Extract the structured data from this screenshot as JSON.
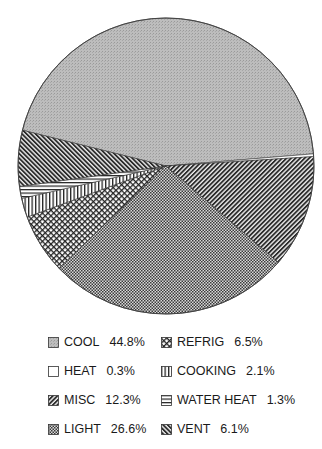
{
  "chart_data": {
    "type": "pie",
    "title": "",
    "start_angle_deg": -166,
    "direction": "clockwise",
    "slices": [
      {
        "label": "COOL",
        "value": 44.8,
        "pattern": "gray-fine",
        "fill": "#b8b8b8"
      },
      {
        "label": "HEAT",
        "value": 0.3,
        "pattern": "white",
        "fill": "#ffffff"
      },
      {
        "label": "MISC",
        "value": 12.3,
        "pattern": "diag-down",
        "fill": "#555555"
      },
      {
        "label": "LIGHT",
        "value": 26.6,
        "pattern": "checker",
        "fill": "#7a7a7a"
      },
      {
        "label": "REFRIG",
        "value": 6.5,
        "pattern": "crosshatch",
        "fill": "#888888"
      },
      {
        "label": "COOKING",
        "value": 2.1,
        "pattern": "vertical",
        "fill": "#cccccc"
      },
      {
        "label": "WATER HEAT",
        "value": 1.3,
        "pattern": "horizontal",
        "fill": "#dddddd"
      },
      {
        "label": "VENT",
        "value": 6.1,
        "pattern": "diag-up",
        "fill": "#555555"
      }
    ],
    "legend": {
      "position": "bottom",
      "columns": 2,
      "entries": [
        {
          "label": "COOL",
          "value_text": "44.8%"
        },
        {
          "label": "HEAT",
          "value_text": "0.3%"
        },
        {
          "label": "MISC",
          "value_text": "12.3%"
        },
        {
          "label": "LIGHT",
          "value_text": "26.6%"
        },
        {
          "label": "REFRIG",
          "value_text": "6.5%"
        },
        {
          "label": "COOKING",
          "value_text": "2.1%"
        },
        {
          "label": "WATER HEAT",
          "value_text": "1.3%"
        },
        {
          "label": "VENT",
          "value_text": "6.1%"
        }
      ]
    }
  }
}
